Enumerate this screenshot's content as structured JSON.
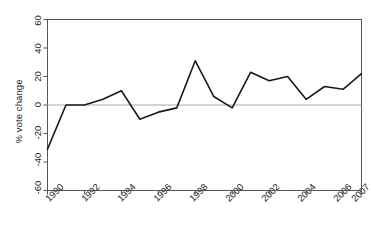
{
  "chart_data": {
    "type": "line",
    "title": "",
    "xlabel": "",
    "ylabel": "% vote change",
    "ylim": [
      -60,
      60
    ],
    "xlim": [
      1990,
      2007
    ],
    "yticks": [
      60,
      40,
      20,
      0,
      -20,
      -40,
      -60
    ],
    "xticks": [
      1990,
      1992,
      1994,
      1996,
      1998,
      2000,
      2002,
      2004,
      2006,
      2007
    ],
    "grid": false,
    "legend": null,
    "zero_line": 0,
    "line_color": "#1a1a1a",
    "axis_color": "#555555",
    "zero_line_color": "#a8a8a8",
    "background": "#ffffff",
    "x": [
      1990,
      1991,
      1992,
      1993,
      1994,
      1995,
      1996,
      1997,
      1998,
      1999,
      2000,
      2001,
      2002,
      2003,
      2004,
      2005,
      2006,
      2007
    ],
    "values": [
      -31,
      0,
      0,
      4,
      10,
      -10,
      -5,
      -2,
      31,
      6,
      -2,
      23,
      17,
      20,
      4,
      13,
      11,
      22
    ],
    "series": [
      {
        "name": "% vote change",
        "values": [
          -31,
          0,
          0,
          4,
          10,
          -10,
          -5,
          -2,
          31,
          6,
          -2,
          23,
          17,
          20,
          4,
          13,
          11,
          22
        ]
      }
    ],
    "ytick_labels": [
      "60",
      "40",
      "20",
      "0",
      "-20",
      "-40",
      "-60"
    ],
    "xtick_labels": [
      "1990",
      "1992",
      "1994",
      "1996",
      "1998",
      "2000",
      "2002",
      "2004",
      "2006",
      "2007"
    ]
  }
}
